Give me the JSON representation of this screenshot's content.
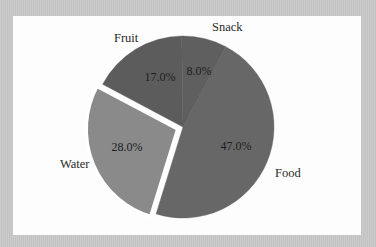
{
  "chart_data": {
    "type": "pie",
    "title": "",
    "categories": [
      "Food",
      "Water",
      "Fruit",
      "Snack"
    ],
    "values": [
      47.0,
      28.0,
      17.0,
      8.0
    ],
    "value_labels": [
      "47.0%",
      "28.0%",
      "17.0%",
      "8.0%"
    ],
    "exploded": [
      "Water"
    ],
    "start_angle_deg_from_top_clockwise": 28,
    "legend": "none",
    "colors": {
      "Food": "#676767",
      "Water": "#8a8a8a",
      "Fruit": "#5c5c5c",
      "Snack": "#5f5f5f"
    }
  },
  "labels": {
    "food": "Food",
    "water": "Water",
    "fruit": "Fruit",
    "snack": "Snack",
    "food_pct": "47.0%",
    "water_pct": "28.0%",
    "fruit_pct": "17.0%",
    "snack_pct": "8.0%"
  }
}
